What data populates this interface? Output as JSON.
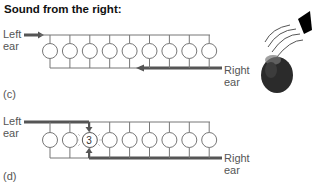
{
  "title": "Sound from the right:",
  "panels": [
    {
      "id": "c",
      "label": "(c)",
      "left_ear_label": [
        "Left",
        "ear"
      ],
      "right_ear_label": [
        "Right",
        "ear"
      ],
      "neuron_count": 9,
      "highlighted_neuron": null
    },
    {
      "id": "d",
      "label": "(d)",
      "left_ear_label": [
        "Left",
        "ear"
      ],
      "right_ear_label": [
        "Right",
        "ear"
      ],
      "neuron_count": 9,
      "highlighted_neuron": "3"
    }
  ],
  "illustration": {
    "source": "speaker-icon",
    "listener": "head-icon",
    "direction": "right"
  },
  "colors": {
    "line": "#666666",
    "thick_line": "#555555",
    "head": "#2a2a2a",
    "speaker": "#000000"
  }
}
